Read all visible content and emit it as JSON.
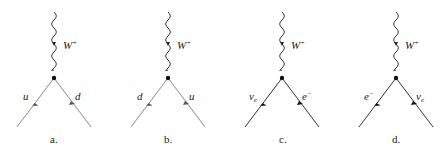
{
  "figure": {
    "diagrams": [
      {
        "id": "a",
        "caption": "a.",
        "boson": "W+",
        "boson_base": "W",
        "boson_sup": "+",
        "left_fermion": "u",
        "right_fermion": "d",
        "line_color": "#8a8a8a",
        "vertex_x": 54
      },
      {
        "id": "b",
        "caption": "b.",
        "boson": "W+",
        "boson_base": "W",
        "boson_sup": "+",
        "left_fermion": "d",
        "right_fermion": "u",
        "line_color": "#8a8a8a",
        "vertex_x": 168
      },
      {
        "id": "c",
        "caption": "c.",
        "boson": "W+",
        "boson_base": "W",
        "boson_sup": "+",
        "left_fermion": "νe",
        "left_fermion_base": "ν",
        "left_fermion_sub": "e",
        "right_fermion": "e−",
        "right_fermion_base": "e",
        "right_fermion_sup": "−",
        "line_color": "#333333",
        "vertex_x": 282
      },
      {
        "id": "d",
        "caption": "d.",
        "boson": "W+",
        "boson_base": "W",
        "boson_sup": "+",
        "left_fermion": "e−",
        "left_fermion_base": "e",
        "left_fermion_sup": "−",
        "right_fermion": "νe",
        "right_fermion_base": "ν",
        "right_fermion_sub": "e",
        "line_color": "#333333",
        "vertex_x": 396
      }
    ]
  }
}
